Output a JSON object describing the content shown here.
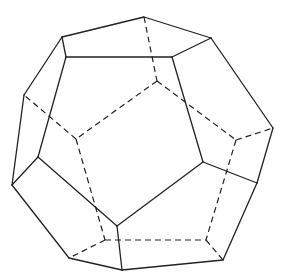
{
  "figure": {
    "style": "wireframe with hidden edges dashed",
    "colors": {
      "background": "#ffffff",
      "line": "#222222"
    },
    "vertices": {
      "v1": [
        144,
        17
      ],
      "v2": [
        62,
        37
      ],
      "v3": [
        211,
        38
      ],
      "v4": [
        66,
        57
      ],
      "v5": [
        172,
        57
      ],
      "v6": [
        24,
        95
      ],
      "v7": [
        273,
        128
      ],
      "v8": [
        38,
        157
      ],
      "v9": [
        12,
        185
      ],
      "v10": [
        117,
        226
      ],
      "v11": [
        203,
        162
      ],
      "v12": [
        257,
        183
      ],
      "v13": [
        69,
        258
      ],
      "v14": [
        122,
        270
      ],
      "v15": [
        223,
        260
      ],
      "h1": [
        157,
        81
      ],
      "h2": [
        76,
        139
      ],
      "h3": [
        236,
        140
      ],
      "h4": [
        105,
        240
      ],
      "h5": [
        206,
        240
      ]
    },
    "solid_edges": [
      [
        "v1",
        "v2"
      ],
      [
        "v1",
        "v3"
      ],
      [
        "v2",
        "v4"
      ],
      [
        "v4",
        "v5"
      ],
      [
        "v5",
        "v3"
      ],
      [
        "v2",
        "v6"
      ],
      [
        "v4",
        "v8"
      ],
      [
        "v6",
        "v9"
      ],
      [
        "v8",
        "v9"
      ],
      [
        "v8",
        "v10"
      ],
      [
        "v9",
        "v13"
      ],
      [
        "v5",
        "v11"
      ],
      [
        "v3",
        "v7"
      ],
      [
        "v11",
        "v10"
      ],
      [
        "v11",
        "v12"
      ],
      [
        "v7",
        "v12"
      ],
      [
        "v12",
        "v15"
      ],
      [
        "v10",
        "v14"
      ],
      [
        "v13",
        "v14"
      ],
      [
        "v14",
        "v15"
      ]
    ],
    "hidden_edges": [
      [
        "v1",
        "h1"
      ],
      [
        "h1",
        "h2"
      ],
      [
        "h1",
        "h3"
      ],
      [
        "h2",
        "v6"
      ],
      [
        "h2",
        "h4"
      ],
      [
        "h3",
        "v7"
      ],
      [
        "h3",
        "h5"
      ],
      [
        "h4",
        "h5"
      ],
      [
        "h4",
        "v13"
      ],
      [
        "h5",
        "v15"
      ]
    ]
  }
}
